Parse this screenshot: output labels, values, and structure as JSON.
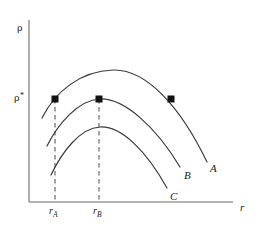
{
  "figure": {
    "type": "line-diagram",
    "background_color": "#ffffff",
    "line_color": "#3a3a3a",
    "axes": {
      "y_label": "ρ",
      "x_label": "r",
      "y_axis_x": 29,
      "y_axis_top": 20,
      "x_axis_y": 202,
      "x_axis_right": 233
    },
    "critical_level": {
      "label": "ρ",
      "superscript": "*",
      "y": 99,
      "line_from_x": 29,
      "line_to_x": 231
    },
    "ticks": [
      {
        "name": "r-sub-a",
        "base": "r",
        "sub": "A",
        "x": 55,
        "label_x": 49,
        "label_y": 206
      },
      {
        "name": "r-sub-b",
        "base": "r",
        "sub": "B",
        "x": 99,
        "label_x": 93,
        "label_y": 206
      }
    ],
    "intersection_points": [
      {
        "name": "point-a-left",
        "x": 55,
        "y": 99
      },
      {
        "name": "point-b-peak",
        "x": 99,
        "y": 99
      },
      {
        "name": "point-a-right",
        "x": 171,
        "y": 99
      }
    ],
    "curves": [
      {
        "name": "curve-a",
        "label": "A",
        "label_x": 210,
        "label_y": 163,
        "path": "M 42 118 C 55 92 80 71 113 70 C 146 69 180 106 207 162",
        "peak": {
          "x": 113,
          "y": 70
        },
        "start": {
          "x": 42,
          "y": 118
        },
        "end": {
          "x": 207,
          "y": 162
        }
      },
      {
        "name": "curve-b",
        "label": "B",
        "label_x": 184,
        "label_y": 170,
        "path": "M 47 146 C 58 124 78 100 100 99 C 124 98 156 127 180 167",
        "peak": {
          "x": 100,
          "y": 99
        },
        "start": {
          "x": 47,
          "y": 146
        },
        "end": {
          "x": 180,
          "y": 167
        }
      },
      {
        "name": "curve-c",
        "label": "C",
        "label_x": 170,
        "label_y": 191,
        "path": "M 51 175 C 62 152 80 128 100 127 C 122 126 147 152 167 188",
        "peak": {
          "x": 100,
          "y": 127
        },
        "start": {
          "x": 51,
          "y": 175
        },
        "end": {
          "x": 167,
          "y": 188
        }
      }
    ],
    "dashed_guides": [
      {
        "name": "guide-r-a",
        "x": 55,
        "y_top": 99,
        "y_bottom": 202
      },
      {
        "name": "guide-r-b",
        "x": 99,
        "y_top": 99,
        "y_bottom": 202
      }
    ]
  }
}
